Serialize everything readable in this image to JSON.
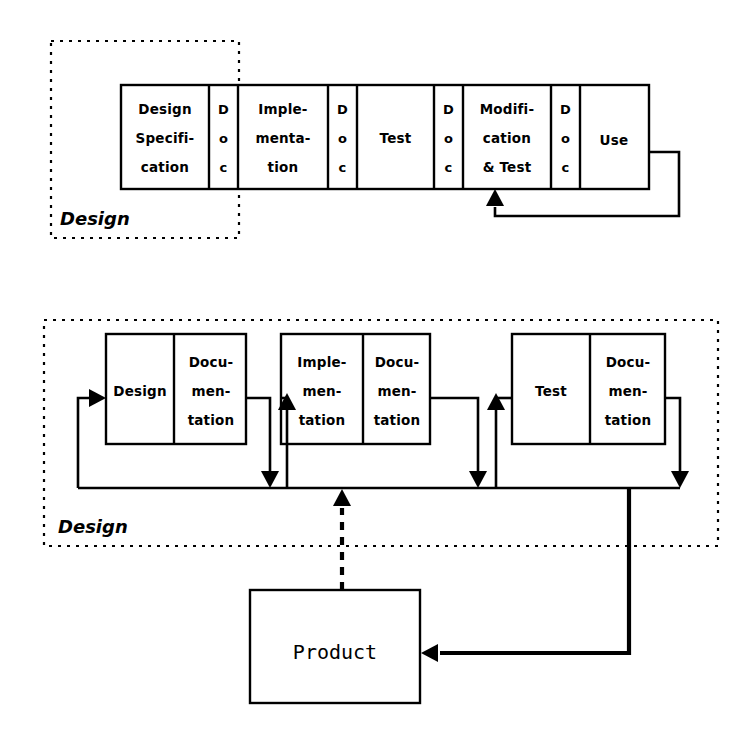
{
  "page": {
    "background_color": "#ffffff",
    "ink_color": "#000000",
    "width": 754,
    "height": 739
  },
  "top_diagram": {
    "frame_label": "Design",
    "cells": [
      {
        "id": "design-specification",
        "label": "Design\nSpecifi-\ncation",
        "lines": [
          "Design",
          "Specifi-",
          "cation"
        ],
        "kind": "phase"
      },
      {
        "id": "doc-1",
        "label": "D\no\nc",
        "lines": [
          "D",
          "o",
          "c"
        ],
        "kind": "doc"
      },
      {
        "id": "implementation",
        "label": "Imple-\nmenta-\ntion",
        "lines": [
          "Imple-",
          "menta-",
          "tion"
        ],
        "kind": "phase"
      },
      {
        "id": "doc-2",
        "label": "D\no\nc",
        "lines": [
          "D",
          "o",
          "c"
        ],
        "kind": "doc"
      },
      {
        "id": "test",
        "label": "Test",
        "lines": [
          "Test"
        ],
        "kind": "phase"
      },
      {
        "id": "doc-3",
        "label": "D\no\nc",
        "lines": [
          "D",
          "o",
          "c"
        ],
        "kind": "doc"
      },
      {
        "id": "modification-and-test",
        "label": "Modifi-\ncation\n& Test",
        "lines": [
          "Modifi-",
          "cation",
          "& Test"
        ],
        "kind": "phase"
      },
      {
        "id": "doc-4",
        "label": "D\no\nc",
        "lines": [
          "D",
          "o",
          "c"
        ],
        "kind": "doc"
      },
      {
        "id": "use",
        "label": "Use",
        "lines": [
          "Use"
        ],
        "kind": "phase"
      }
    ],
    "feedback_arrow": {
      "from": "use",
      "to": "modification-and-test",
      "style": "solid",
      "direction": "up"
    }
  },
  "bottom_diagram": {
    "frame_label": "Design",
    "groups": [
      {
        "id": "design-group",
        "phase": {
          "id": "design",
          "lines": [
            "Design"
          ]
        },
        "documentation": {
          "id": "documentation-1",
          "lines": [
            "Docu-",
            "men-",
            "tation"
          ]
        }
      },
      {
        "id": "implementation-group",
        "phase": {
          "id": "implementation",
          "lines": [
            "Imple-",
            "men-",
            "tation"
          ]
        },
        "documentation": {
          "id": "documentation-2",
          "lines": [
            "Docu-",
            "men-",
            "tation"
          ]
        }
      },
      {
        "id": "test-group",
        "phase": {
          "id": "test",
          "lines": [
            "Test"
          ]
        },
        "documentation": {
          "id": "documentation-3",
          "lines": [
            "Docu-",
            "men-",
            "tation"
          ]
        }
      }
    ],
    "connections": [
      {
        "id": "bus-to-design",
        "style": "solid",
        "direction": "right",
        "description": "bus feedback returns into Design box"
      },
      {
        "id": "design-group-to-bus",
        "style": "solid",
        "direction": "down"
      },
      {
        "id": "bus-to-implementation",
        "style": "solid",
        "direction": "up"
      },
      {
        "id": "implementation-group-to-bus",
        "style": "solid",
        "direction": "down"
      },
      {
        "id": "bus-to-test",
        "style": "solid",
        "direction": "up"
      },
      {
        "id": "test-group-to-bus",
        "style": "solid",
        "direction": "down"
      },
      {
        "id": "product-to-bus",
        "style": "dashed",
        "direction": "up"
      },
      {
        "id": "test-to-product",
        "style": "solid-thick",
        "direction": "left"
      }
    ]
  },
  "product": {
    "id": "product",
    "label": "Product"
  }
}
